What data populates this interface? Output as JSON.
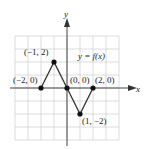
{
  "chart_data": {
    "type": "line",
    "title": "",
    "function_label": "y = f(x)",
    "xlabel": "x",
    "ylabel": "y",
    "xlim": [
      -4,
      4
    ],
    "ylim": [
      -4,
      4
    ],
    "grid": true,
    "points": [
      {
        "x": -2,
        "y": 0,
        "label": "(−2, 0)"
      },
      {
        "x": -1,
        "y": 2,
        "label": "(−1, 2)"
      },
      {
        "x": 0,
        "y": 0,
        "label": "(0, 0)"
      },
      {
        "x": 1,
        "y": -2,
        "label": "(1, −2)"
      },
      {
        "x": 2,
        "y": 0,
        "label": "(2, 0)"
      }
    ]
  }
}
